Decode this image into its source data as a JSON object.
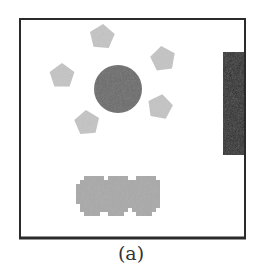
{
  "figure": {
    "caption": "(a)",
    "colors": {
      "frame": "#2b2b2b",
      "circle": "#6b6b6b",
      "pentagon": "#c4c4c4",
      "wall_block": "#2a2a2a",
      "cluster": "#a9a9a9",
      "background": "#ffffff"
    },
    "arena": {
      "x": 20,
      "y": 19,
      "width": 225,
      "height": 219
    },
    "circle": {
      "cx": 118,
      "cy": 89,
      "r": 24
    },
    "pentagons": [
      {
        "cx": 102,
        "cy": 37,
        "r": 13,
        "rot": 5
      },
      {
        "cx": 163,
        "cy": 59,
        "r": 13,
        "rot": -8
      },
      {
        "cx": 62,
        "cy": 76,
        "r": 13,
        "rot": 0
      },
      {
        "cx": 160,
        "cy": 107,
        "r": 13,
        "rot": 10
      },
      {
        "cx": 87,
        "cy": 123,
        "r": 13,
        "rot": -5
      }
    ],
    "wall_block": {
      "x": 223,
      "y": 52,
      "width": 21,
      "height": 103
    },
    "cluster_blobs": [
      {
        "cx": 92,
        "cy": 193
      },
      {
        "cx": 118,
        "cy": 193
      },
      {
        "cx": 144,
        "cy": 193
      }
    ]
  }
}
